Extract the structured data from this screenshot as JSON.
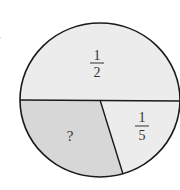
{
  "problem_label": ".",
  "diagram": {
    "type": "circle-fraction",
    "sections": [
      {
        "id": "top-half",
        "numerator": "1",
        "denominator": "2",
        "fill": "#ececec"
      },
      {
        "id": "fifth",
        "numerator": "1",
        "denominator": "5",
        "fill": "#ececec"
      },
      {
        "id": "unknown",
        "label": "?",
        "fill": "#d7d7d7"
      }
    ],
    "stroke": "#1a1a1a"
  }
}
